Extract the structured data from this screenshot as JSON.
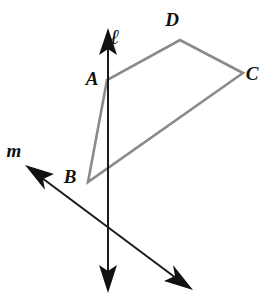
{
  "figure": {
    "canvas": {
      "width": 276,
      "height": 305,
      "background": "#ffffff"
    },
    "colors": {
      "quadrilateral_stroke": "#8a8a8a",
      "line_stroke": "#1a1a1a",
      "label_color": "#111111",
      "background": "#ffffff"
    }
  },
  "labels": {
    "A": "A",
    "B": "B",
    "C": "C",
    "D": "D",
    "line_l": "ℓ",
    "line_m": "m"
  },
  "label_positions": {
    "A": {
      "x": 92,
      "y": 85
    },
    "B": {
      "x": 70,
      "y": 183
    },
    "C": {
      "x": 252,
      "y": 80
    },
    "D": {
      "x": 172,
      "y": 26
    },
    "line_l": {
      "x": 115,
      "y": 44
    },
    "line_m": {
      "x": 14,
      "y": 157
    }
  },
  "points": {
    "A": {
      "x": 107,
      "y": 80
    },
    "B": {
      "x": 88,
      "y": 182
    },
    "C": {
      "x": 243,
      "y": 73
    },
    "D": {
      "x": 180,
      "y": 40
    }
  },
  "shapes": {
    "quadrilateral": {
      "name": "ABCD",
      "vertices": [
        "A",
        "B",
        "C",
        "D"
      ],
      "path": "M 107 80 L 88 182 L 243 73 L 180 40 Z",
      "stroke": "#8a8a8a",
      "stroke_width": 2.6,
      "fill": "none"
    }
  },
  "lines": [
    {
      "id": "line-l",
      "label": "ℓ",
      "orientation": "vertical",
      "x1": 108,
      "y1": 28,
      "x2": 108,
      "y2": 293,
      "stroke": "#1a1a1a",
      "stroke_width": 2,
      "arrow_start": true,
      "arrow_end": true,
      "passes_through": [
        "A"
      ]
    },
    {
      "id": "line-m",
      "label": "m",
      "orientation": "diagonal",
      "x1": 25,
      "y1": 165,
      "x2": 193,
      "y2": 290,
      "stroke": "#1a1a1a",
      "stroke_width": 2,
      "arrow_start": true,
      "arrow_end": true,
      "passes_through": []
    }
  ],
  "intersection": {
    "lines": [
      "line-l",
      "line-m"
    ],
    "x": 108,
    "y": 227
  }
}
